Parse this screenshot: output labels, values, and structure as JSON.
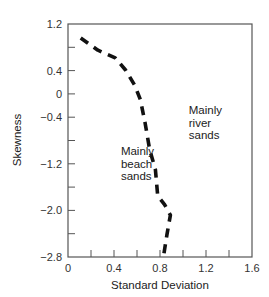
{
  "chart_data": {
    "type": "line",
    "title": "",
    "xlabel": "Standard Deviation",
    "ylabel": "Skewness",
    "xlim": [
      0,
      1.6
    ],
    "ylim": [
      -2.8,
      1.2
    ],
    "x_ticks": [
      0,
      0.2,
      0.4,
      0.6,
      0.8,
      1.0,
      1.2,
      1.4,
      1.6
    ],
    "x_tick_labels": [
      "0",
      "",
      "0.4",
      "",
      "0.8",
      "",
      "1.2",
      "",
      "1.6"
    ],
    "y_ticks": [
      1.2,
      0.8,
      0.4,
      0,
      -0.4,
      -0.8,
      -1.2,
      -1.6,
      -2.0,
      -2.4,
      -2.8
    ],
    "y_tick_labels": [
      "1.2",
      "",
      "0.4",
      "0",
      "−0.4",
      "",
      "−1.2",
      "",
      "−2.0",
      "",
      "−2.8"
    ],
    "grid": false,
    "series": [
      {
        "name": "Boundary",
        "style": "dashed",
        "x": [
          0.11,
          0.26,
          0.41,
          0.5,
          0.58,
          0.63,
          0.67,
          0.71,
          0.76,
          0.78,
          0.84,
          0.89,
          0.86,
          0.83
        ],
        "y": [
          0.96,
          0.75,
          0.62,
          0.41,
          0.15,
          -0.1,
          -0.5,
          -0.95,
          -1.3,
          -1.75,
          -1.9,
          -2.08,
          -2.42,
          -2.8
        ]
      }
    ],
    "annotations": [
      {
        "text": [
          "Mainly",
          "beach",
          "sands"
        ],
        "x": 0.46,
        "y": -1.05
      },
      {
        "text": [
          "Mainly",
          "river",
          "sands"
        ],
        "x": 1.05,
        "y": -0.35
      }
    ]
  }
}
